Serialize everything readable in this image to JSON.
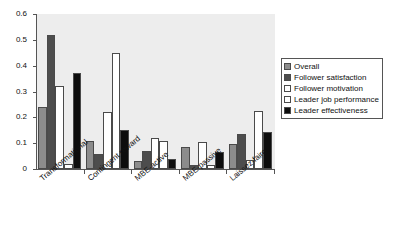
{
  "chart_data": {
    "type": "bar",
    "title": "",
    "subtitle": "",
    "xlabel": "",
    "ylabel": "",
    "ylim": [
      0,
      0.6
    ],
    "yticks": [
      "0",
      "0.1",
      "0.2",
      "0.3",
      "0.4",
      "0.5",
      "0.6"
    ],
    "ytick_values": [
      0,
      0.1,
      0.2,
      0.3,
      0.4,
      0.5,
      0.6
    ],
    "grid": false,
    "legend_position": "right",
    "plot_background": "#ededed",
    "categories": [
      "Transformational",
      "Contingent reward",
      "MBE-active",
      "MBE-passive",
      "Laissez-faire"
    ],
    "series": [
      {
        "name": "Overall",
        "color": "#8c8c8c",
        "values": [
          0.24,
          0.11,
          0.03,
          0.085,
          0.095
        ]
      },
      {
        "name": "Follower satisfaction",
        "color": "#4d4d4d",
        "values": [
          0.52,
          0.06,
          0.07,
          0.015,
          0.135
        ]
      },
      {
        "name": "Follower motivation",
        "color": "#ffffff",
        "values": [
          0.32,
          0.22,
          0.12,
          0.105,
          0.035
        ]
      },
      {
        "name": "Leader job performance",
        "color": "#ffffff",
        "values": [
          0.02,
          0.45,
          0.11,
          0.015,
          0.225
        ]
      },
      {
        "name": "Leader effectiveness",
        "color": "#0d0d0d",
        "values": [
          0.37,
          0.15,
          0.04,
          0.065,
          0.145
        ]
      }
    ]
  },
  "legend": {
    "items": [
      {
        "label": "Overall",
        "color": "#8c8c8c"
      },
      {
        "label": "Follower satisfaction",
        "color": "#4d4d4d"
      },
      {
        "label": "Follower motivation",
        "color": "#ffffff"
      },
      {
        "label": "Leader job performance",
        "color": "#ffffff"
      },
      {
        "label": "Leader effectiveness",
        "color": "#0d0d0d"
      }
    ]
  }
}
